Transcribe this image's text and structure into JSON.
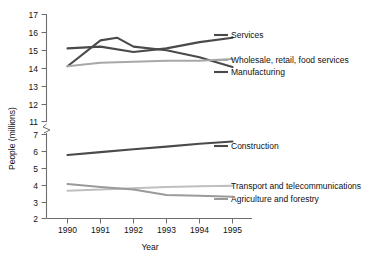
{
  "chart_data": {
    "type": "line",
    "title": "",
    "xlabel": "Year",
    "ylabel": "People (millions)",
    "x": [
      1990,
      1991,
      1992,
      1993,
      1994,
      1995
    ],
    "xlim": [
      1990,
      1995
    ],
    "grid": false,
    "legend_position": "right-inline-labels",
    "axis_break": {
      "present": true,
      "between": [
        7,
        11
      ],
      "note": "y-axis broken between 7 and 11"
    },
    "y_ticks_upper": [
      11,
      12,
      13,
      14,
      15,
      16,
      17
    ],
    "y_ticks_lower": [
      2,
      3,
      4,
      5,
      6,
      7
    ],
    "series": [
      {
        "name": "Services",
        "color": "#4a4a4a",
        "width": 2.1,
        "values": [
          15.1,
          15.2,
          14.9,
          15.1,
          15.45,
          15.7
        ]
      },
      {
        "name": "Manufacturing",
        "color": "#4a4a4a",
        "width": 2.1,
        "values": [
          14.1,
          15.55,
          15.2,
          15.0,
          14.6,
          14.05
        ]
      },
      {
        "name": "Wholesale, retail, food services",
        "color": "#a8a8a8",
        "width": 2.0,
        "values": [
          14.1,
          14.3,
          14.35,
          14.4,
          14.4,
          14.5
        ]
      },
      {
        "name": "Construction",
        "color": "#4a4a4a",
        "width": 2.1,
        "values": [
          5.78,
          5.95,
          6.12,
          6.28,
          6.45,
          6.58
        ]
      },
      {
        "name": "Transport and telecommunications",
        "color": "#bfbfbf",
        "width": 2.0,
        "values": [
          3.65,
          3.72,
          3.8,
          3.88,
          3.92,
          3.95
        ]
      },
      {
        "name": "Agriculture and forestry",
        "color": "#9a9a9a",
        "width": 2.0,
        "values": [
          4.05,
          3.88,
          3.72,
          3.4,
          3.35,
          3.3
        ]
      }
    ],
    "series_labels": [
      {
        "text": "Services",
        "key": "services"
      },
      {
        "text": "Wholesale, retail, food services",
        "key": "wholesale"
      },
      {
        "text": "Manufacturing",
        "key": "manufacturing"
      },
      {
        "text": "Construction",
        "key": "construction"
      },
      {
        "text": "Transport and telecommunications",
        "key": "transport"
      },
      {
        "text": "Agriculture and forestry",
        "key": "agriculture"
      }
    ],
    "tick_labels_y": [
      "17",
      "16",
      "15",
      "14",
      "13",
      "12",
      "11",
      "7",
      "6",
      "5",
      "4",
      "3",
      "2"
    ],
    "tick_labels_x": [
      "1990",
      "1991",
      "1992",
      "1993",
      "1994",
      "1995"
    ]
  }
}
